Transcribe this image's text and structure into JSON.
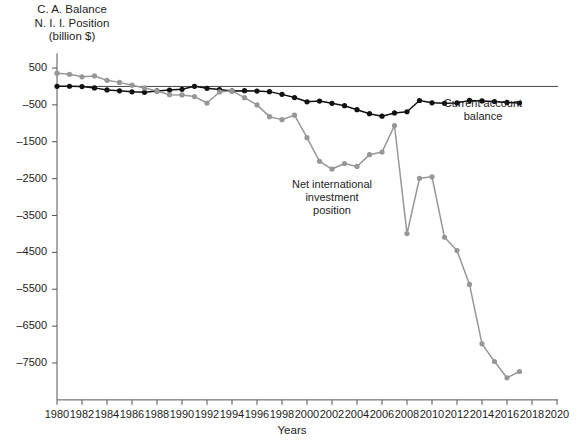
{
  "chart_data": {
    "type": "line",
    "title": "",
    "ylabel": "C. A. Balance\nN. I. I. Position\n(billion $)",
    "xlabel": "Years",
    "xlim": [
      1980,
      2020
    ],
    "ylim": [
      -8500,
      900
    ],
    "yticks": [
      500,
      -500,
      -1500,
      -2500,
      -3500,
      -4500,
      -5500,
      -6500,
      -7500
    ],
    "ytick_labels": [
      "500",
      "–500",
      "–1500",
      "–2500",
      "–3500",
      "–4500",
      "–5500",
      "–6500",
      "–7500"
    ],
    "xticks": [
      1980,
      1982,
      1984,
      1986,
      1988,
      1990,
      1992,
      1994,
      1996,
      1998,
      2000,
      2002,
      2004,
      2006,
      2008,
      2010,
      2012,
      2014,
      2016,
      2018,
      2020
    ],
    "xtick_labels": [
      "1980",
      "1982",
      "1984",
      "1986",
      "1988",
      "1990",
      "1992",
      "1994",
      "1996",
      "1998",
      "2000",
      "2002",
      "2004",
      "2006",
      "2008",
      "2010",
      "2012",
      "2014",
      "2016",
      "2018",
      "2020"
    ],
    "grid": false,
    "legend_position": "inline-annotations",
    "zero_line": true,
    "colors": {
      "current_account_balance": "#111111",
      "net_international_investment_position": "#979797",
      "axis": "#555555",
      "zero_line": "#333333"
    },
    "x": [
      1980,
      1981,
      1982,
      1983,
      1984,
      1985,
      1986,
      1987,
      1988,
      1989,
      1990,
      1991,
      1992,
      1993,
      1994,
      1995,
      1996,
      1997,
      1998,
      1999,
      2000,
      2001,
      2002,
      2003,
      2004,
      2005,
      2006,
      2007,
      2008,
      2009,
      2010,
      2011,
      2012,
      2013,
      2014,
      2015,
      2016,
      2017
    ],
    "series": [
      {
        "name": "Current account balance",
        "color": "#111111",
        "marker": "circle",
        "values": [
          2,
          5,
          -5,
          -39,
          -94,
          -118,
          -147,
          -161,
          -122,
          -99,
          -79,
          3,
          -50,
          -85,
          -122,
          -114,
          -125,
          -141,
          -215,
          -301,
          -416,
          -397,
          -459,
          -522,
          -630,
          -739,
          -807,
          -719,
          -686,
          -381,
          -444,
          -459,
          -446,
          -379,
          -392,
          -408,
          -433,
          -449
        ]
      },
      {
        "name": "Net international investment position",
        "color": "#979797",
        "marker": "circle",
        "values": [
          360,
          330,
          260,
          285,
          165,
          110,
          35,
          -40,
          -125,
          -225,
          -230,
          -275,
          -450,
          -150,
          -120,
          -305,
          -500,
          -820,
          -900,
          -780,
          -1390,
          -2030,
          -2240,
          -2090,
          -2170,
          -1850,
          -1780,
          -1060,
          -3990,
          -2490,
          -2450,
          -4090,
          -4450,
          -5370,
          -6980,
          -7460,
          -7900,
          -7730
        ]
      }
    ]
  },
  "annotations": {
    "current_account": "Current account\nbalance",
    "niip": "Net international\ninvestment\nposition"
  }
}
